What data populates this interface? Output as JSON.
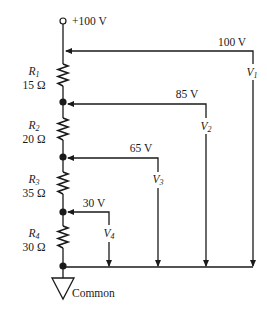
{
  "diagram": {
    "type": "voltage-divider circuit",
    "supply": {
      "label": "+100 V"
    },
    "ground": {
      "label": "Common"
    },
    "resistors": [
      {
        "name": "R",
        "sub": "1",
        "value": "15 Ω"
      },
      {
        "name": "R",
        "sub": "2",
        "value": "20 Ω"
      },
      {
        "name": "R",
        "sub": "3",
        "value": "35 Ω"
      },
      {
        "name": "R",
        "sub": "4",
        "value": "30 Ω"
      }
    ],
    "taps": [
      {
        "voltage": "100 V",
        "meter": "V",
        "sub": "1"
      },
      {
        "voltage": "85 V",
        "meter": "V",
        "sub": "2"
      },
      {
        "voltage": "65 V",
        "meter": "V",
        "sub": "3"
      },
      {
        "voltage": "30 V",
        "meter": "V",
        "sub": "4"
      }
    ]
  }
}
